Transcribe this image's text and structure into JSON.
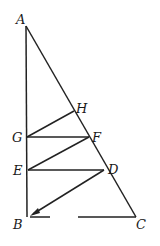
{
  "diagram": {
    "points": {
      "A": {
        "label": "A",
        "x": 26,
        "y": 26
      },
      "B": {
        "label": "B",
        "x": 27,
        "y": 217
      },
      "C": {
        "label": "C",
        "x": 136,
        "y": 217
      },
      "H": {
        "label": "H",
        "x": 74,
        "y": 111
      },
      "G": {
        "label": "G",
        "x": 27,
        "y": 137
      },
      "F": {
        "label": "F",
        "x": 89,
        "y": 137
      },
      "E": {
        "label": "E",
        "x": 28,
        "y": 170
      },
      "D": {
        "label": "D",
        "x": 104,
        "y": 170
      }
    },
    "segments": [
      [
        "A",
        "B"
      ],
      [
        "A",
        "C"
      ],
      [
        "B",
        "C"
      ],
      [
        "H",
        "G"
      ],
      [
        "G",
        "F"
      ],
      [
        "F",
        "E"
      ],
      [
        "E",
        "D"
      ],
      [
        "D",
        "B"
      ]
    ],
    "labels": {
      "A": "A",
      "B": "B",
      "C": "C",
      "D": "D",
      "E": "E",
      "F": "F",
      "G": "G",
      "H": "H"
    }
  }
}
